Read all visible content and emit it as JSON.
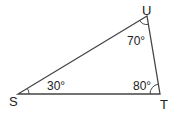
{
  "diagram": {
    "type": "triangle",
    "vertices": [
      {
        "id": "S",
        "label": "S"
      },
      {
        "id": "T",
        "label": "T"
      },
      {
        "id": "U",
        "label": "U"
      }
    ],
    "angles": [
      {
        "vertex": "S",
        "label": "30°",
        "value_deg": 30
      },
      {
        "vertex": "T",
        "label": "80°",
        "value_deg": 80
      },
      {
        "vertex": "U",
        "label": "70°",
        "value_deg": 70
      }
    ],
    "edges": [
      [
        "S",
        "T"
      ],
      [
        "T",
        "U"
      ],
      [
        "U",
        "S"
      ]
    ],
    "stroke_color": "#444444"
  }
}
